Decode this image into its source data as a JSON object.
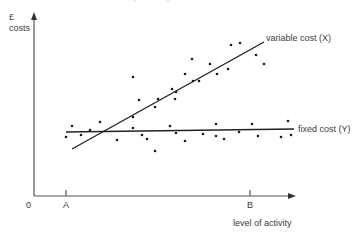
{
  "chart_data": {
    "type": "scatter",
    "title": "",
    "xlabel": "level of activity",
    "ylabel_unit": "£",
    "ylabel": "costs",
    "origin_label": "0",
    "x_ticks": [
      {
        "label": "A",
        "x": 66
      },
      {
        "label": "B",
        "x": 250
      }
    ],
    "grid": false,
    "legend": "none (inline line labels)",
    "series": [
      {
        "name": "variable cost (X)",
        "kind": "regression-line",
        "label": "variable cost (X)",
        "line": {
          "x1": 72,
          "y1": 149,
          "x2": 264,
          "y2": 42
        },
        "points": [
          [
            133,
            77
          ],
          [
            139,
            100
          ],
          [
            133,
            117
          ],
          [
            155,
            107
          ],
          [
            158,
            99
          ],
          [
            172,
            89
          ],
          [
            175,
            99
          ],
          [
            176,
            92
          ],
          [
            185,
            74
          ],
          [
            192,
            59
          ],
          [
            193,
            81
          ],
          [
            199,
            81
          ],
          [
            210,
            64
          ],
          [
            217,
            74
          ],
          [
            228,
            69
          ],
          [
            231,
            45
          ],
          [
            240,
            43
          ],
          [
            256,
            55
          ],
          [
            264,
            64
          ]
        ]
      },
      {
        "name": "fixed cost (Y)",
        "kind": "regression-line",
        "label": "fixed cost (Y)",
        "line": {
          "x1": 66,
          "y1": 132,
          "x2": 294,
          "y2": 129
        },
        "points": [
          [
            66,
            137
          ],
          [
            72,
            126
          ],
          [
            81,
            135
          ],
          [
            90,
            130
          ],
          [
            100,
            122
          ],
          [
            117,
            140
          ],
          [
            133,
            128
          ],
          [
            142,
            135
          ],
          [
            147,
            139
          ],
          [
            155,
            151
          ],
          [
            170,
            126
          ],
          [
            176,
            133
          ],
          [
            185,
            141
          ],
          [
            203,
            134
          ],
          [
            216,
            136
          ],
          [
            216,
            124
          ],
          [
            224,
            139
          ],
          [
            239,
            132
          ],
          [
            252,
            124
          ],
          [
            258,
            136
          ],
          [
            281,
            137
          ],
          [
            288,
            121
          ],
          [
            291,
            135
          ]
        ]
      }
    ],
    "xlim": [
      0,
      300
    ],
    "ylim": [
      0,
      200
    ]
  },
  "labels": {
    "y_unit": "£",
    "y_axis": "costs",
    "x_axis": "level of activity",
    "origin": "0",
    "tick_a": "A",
    "tick_b": "B",
    "variable": "variable cost (X)",
    "fixed": "fixed cost (Y)"
  }
}
